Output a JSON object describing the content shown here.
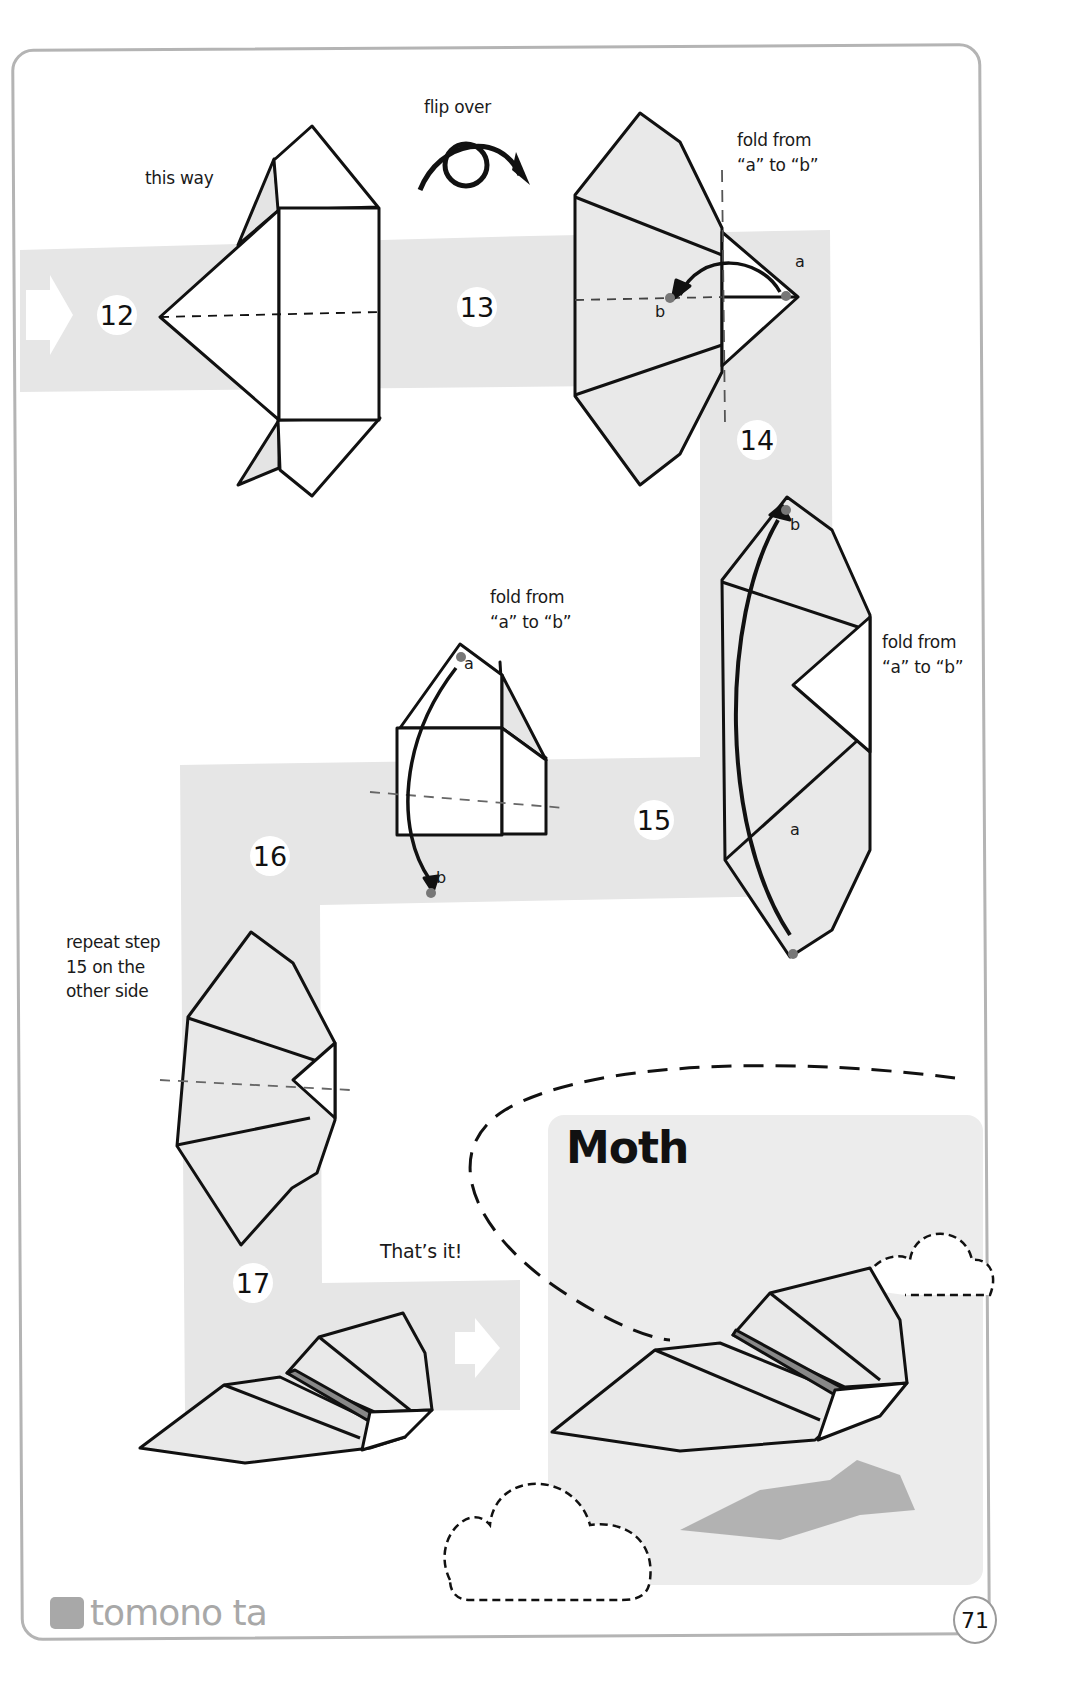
{
  "page": {
    "title": "Moth",
    "page_number": "71",
    "brand": "tomono ta"
  },
  "steps": [
    {
      "number": "12",
      "note": "this way"
    },
    {
      "number": "13",
      "note": "flip over"
    },
    {
      "number": "14",
      "note_line1": "fold from",
      "note_line2": "“a” to “b”",
      "point_a": "a",
      "point_b": "b"
    },
    {
      "number": "15",
      "note_line1": "fold from",
      "note_line2": "“a” to “b”",
      "point_a": "a",
      "point_b": "b"
    },
    {
      "number": "16",
      "note_line1": "fold from",
      "note_line2": "“a” to “b”",
      "point_a": "a",
      "point_b": "b"
    },
    {
      "number": "17",
      "note_line1": "repeat step",
      "note_line2": "15 on the",
      "note_line3": "other side"
    }
  ],
  "finish": {
    "label": "That’s it!"
  },
  "colors": {
    "band": "#e6e6e6",
    "frame": "#b4b4b4",
    "paper": "#eaeaea",
    "line": "#111111",
    "point": "#777777",
    "shadow": "#9a9a9a"
  }
}
